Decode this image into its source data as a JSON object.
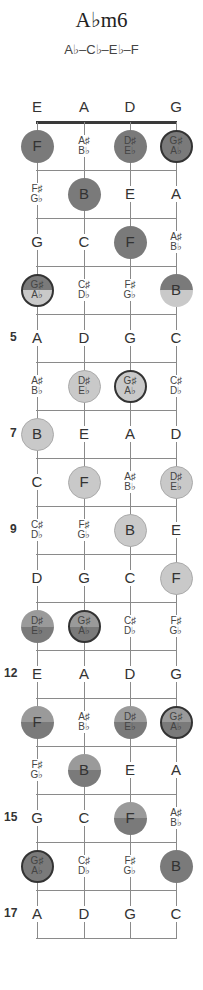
{
  "title": "A♭m6",
  "subtitle": "A♭–C♭–E♭–F",
  "strings": [
    "E",
    "A",
    "D",
    "G"
  ],
  "fret_numbers": [
    {
      "fret": 5,
      "label": "5"
    },
    {
      "fret": 7,
      "label": "7"
    },
    {
      "fret": 9,
      "label": "9"
    },
    {
      "fret": 12,
      "label": "12"
    },
    {
      "fret": 15,
      "label": "15"
    },
    {
      "fret": 17,
      "label": "17"
    }
  ],
  "colors": {
    "dark_dot": "#7a7a7a",
    "light_dot": "#c9c9c9",
    "root_border": "#333333",
    "line": "#8a8a8a",
    "nut": "#3a3a3a"
  },
  "frets": [
    {
      "fret": 1,
      "cells": [
        {
          "n": "F",
          "dot": "dark"
        },
        {
          "n": "A♯|B♭"
        },
        {
          "n": "D♯|E♭",
          "dot": "dark"
        },
        {
          "n": "G♯|A♭",
          "dot": "dark",
          "root": true
        }
      ]
    },
    {
      "fret": 2,
      "cells": [
        {
          "n": "F♯|G♭"
        },
        {
          "n": "B",
          "dot": "dark"
        },
        {
          "n": "E"
        },
        {
          "n": "A"
        }
      ]
    },
    {
      "fret": 3,
      "cells": [
        {
          "n": "G"
        },
        {
          "n": "C"
        },
        {
          "n": "F",
          "dot": "dark"
        },
        {
          "n": "A♯|B♭"
        }
      ]
    },
    {
      "fret": 4,
      "cells": [
        {
          "n": "G♯|A♭",
          "dot": "split-low",
          "root": true
        },
        {
          "n": "C♯|D♭"
        },
        {
          "n": "F♯|G♭"
        },
        {
          "n": "B",
          "dot": "split-low"
        }
      ]
    },
    {
      "fret": 5,
      "cells": [
        {
          "n": "A"
        },
        {
          "n": "D"
        },
        {
          "n": "G"
        },
        {
          "n": "C"
        }
      ]
    },
    {
      "fret": 6,
      "cells": [
        {
          "n": "A♯|B♭"
        },
        {
          "n": "D♯|E♭",
          "dot": "light"
        },
        {
          "n": "G♯|A♭",
          "dot": "light",
          "root": true
        },
        {
          "n": "C♯|D♭"
        }
      ]
    },
    {
      "fret": 7,
      "cells": [
        {
          "n": "B",
          "dot": "light"
        },
        {
          "n": "E"
        },
        {
          "n": "A"
        },
        {
          "n": "D"
        }
      ]
    },
    {
      "fret": 8,
      "cells": [
        {
          "n": "C"
        },
        {
          "n": "F",
          "dot": "light"
        },
        {
          "n": "A♯|B♭"
        },
        {
          "n": "D♯|E♭",
          "dot": "light"
        }
      ]
    },
    {
      "fret": 9,
      "cells": [
        {
          "n": "C♯|D♭"
        },
        {
          "n": "F♯|G♭"
        },
        {
          "n": "B",
          "dot": "light"
        },
        {
          "n": "E"
        }
      ]
    },
    {
      "fret": 10,
      "cells": [
        {
          "n": "D"
        },
        {
          "n": "G"
        },
        {
          "n": "C"
        },
        {
          "n": "F",
          "dot": "light"
        }
      ]
    },
    {
      "fret": 11,
      "cells": [
        {
          "n": "D♯|E♭",
          "dot": "split-high"
        },
        {
          "n": "G♯|A♭",
          "dot": "split-high",
          "root": true
        },
        {
          "n": "C♯|D♭"
        },
        {
          "n": "F♯|G♭"
        }
      ]
    },
    {
      "fret": 12,
      "cells": [
        {
          "n": "E"
        },
        {
          "n": "A"
        },
        {
          "n": "D"
        },
        {
          "n": "G"
        }
      ]
    },
    {
      "fret": 13,
      "cells": [
        {
          "n": "F",
          "dot": "split-high"
        },
        {
          "n": "A♯|B♭"
        },
        {
          "n": "D♯|E♭",
          "dot": "split-high"
        },
        {
          "n": "G♯|A♭",
          "dot": "split-high",
          "root": true
        }
      ]
    },
    {
      "fret": 14,
      "cells": [
        {
          "n": "F♯|G♭"
        },
        {
          "n": "B",
          "dot": "split-high"
        },
        {
          "n": "E"
        },
        {
          "n": "A"
        }
      ]
    },
    {
      "fret": 15,
      "cells": [
        {
          "n": "G"
        },
        {
          "n": "C"
        },
        {
          "n": "F",
          "dot": "split-high"
        },
        {
          "n": "A♯|B♭"
        }
      ]
    },
    {
      "fret": 16,
      "cells": [
        {
          "n": "G♯|A♭",
          "dot": "dark",
          "root": true
        },
        {
          "n": "C♯|D♭"
        },
        {
          "n": "F♯|G♭"
        },
        {
          "n": "B",
          "dot": "dark"
        }
      ]
    },
    {
      "fret": 17,
      "cells": [
        {
          "n": "A"
        },
        {
          "n": "D"
        },
        {
          "n": "G"
        },
        {
          "n": "C"
        }
      ]
    }
  ]
}
